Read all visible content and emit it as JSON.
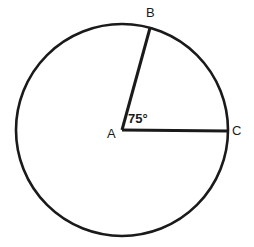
{
  "figure": {
    "background_color": "#ffffff",
    "stroke_color": "#1a1a1a",
    "circle": {
      "name": "circle",
      "center_x": 122,
      "center_y": 130,
      "radius": 106,
      "stroke_width": 2.6
    },
    "points": [
      {
        "id": "A",
        "label": "A",
        "role": "center",
        "x": 122,
        "y": 130
      },
      {
        "id": "B",
        "label": "B",
        "role": "on-circle",
        "x": 150,
        "y": 28
      },
      {
        "id": "C",
        "label": "C",
        "role": "on-circle",
        "x": 228,
        "y": 131
      }
    ],
    "segments": [
      {
        "name": "radius-AB",
        "from": "A",
        "to": "B",
        "stroke_width": 3
      },
      {
        "name": "radius-AC",
        "from": "A",
        "to": "C",
        "stroke_width": 3
      }
    ],
    "angle": {
      "name": "angle-BAC",
      "vertex": "A",
      "value": 75,
      "unit": "degrees",
      "label": "75°"
    }
  }
}
